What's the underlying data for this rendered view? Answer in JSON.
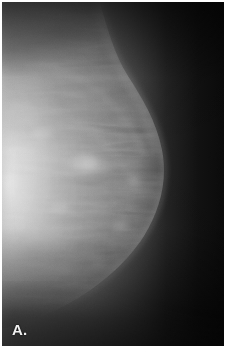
{
  "figure": {
    "panel_label": "A.",
    "modality": "mammogram",
    "view_description": "craniocaudal mammographic view, breast tissue at left, air/background at right",
    "background_color": "#0a0a0a",
    "page_color": "#ffffff",
    "border": {
      "margin_px": 2,
      "color": "#ffffff"
    }
  },
  "image_regions": {
    "brightest_tissue": {
      "name": "dense-fibroglandular-tissue",
      "color": "#d9d9d9",
      "center_x_pct": 6,
      "center_y_pct": 54
    },
    "mid_tissue": {
      "name": "breast-parenchyma",
      "color": "#8f8f8f"
    },
    "skin_line": {
      "name": "skin-contour-edge",
      "color": "#b4b4b4"
    },
    "focal_density": {
      "name": "focal-asymmetric-density",
      "color": "#c4c4c4",
      "center_x_pct": 38,
      "center_y_pct": 47
    },
    "air_background": {
      "name": "air-background",
      "color": "#0b0b0b"
    },
    "upper_soft_tissue": {
      "name": "upper-soft-tissue-band",
      "color": "#4a4a4a"
    },
    "lower_soft_tissue": {
      "name": "inferior-soft-tissue-band",
      "color": "#3a3a3a"
    }
  },
  "grayscale_ramp": {
    "black": "#070707",
    "near_black": "#121212",
    "dark": "#262626",
    "mid_dark": "#4d4d4d",
    "mid": "#7a7a7a",
    "mid_light": "#a3a3a3",
    "light": "#c6c6c6",
    "near_white": "#dedede"
  }
}
